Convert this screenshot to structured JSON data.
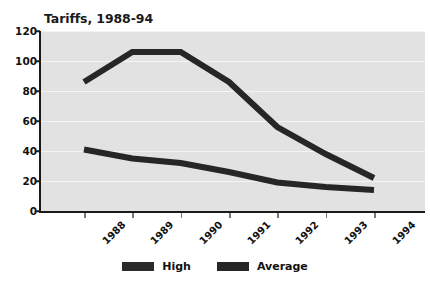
{
  "chart_data": {
    "type": "line",
    "title": "Tariffs, 1988-94",
    "xlabel": "",
    "ylabel": "",
    "categories": [
      "1988",
      "1989",
      "1990",
      "1991",
      "1992",
      "1993",
      "1994"
    ],
    "series": [
      {
        "name": "High",
        "values": [
          86,
          106,
          106,
          86,
          56,
          38,
          22
        ]
      },
      {
        "name": "Average",
        "values": [
          41,
          35,
          32,
          26,
          19,
          16,
          14
        ]
      }
    ],
    "ylim": [
      0,
      120
    ],
    "yticks": [
      0,
      20,
      40,
      60,
      80,
      100,
      120
    ],
    "ytick_labels": [
      "0",
      "20",
      "40",
      "60",
      "80",
      "100",
      "120"
    ],
    "grid": true,
    "grid_axis": "y",
    "legend_position": "bottom",
    "legend_entries": [
      "High",
      "Average"
    ],
    "colors": {
      "high": "#262626",
      "average": "#262626",
      "plot_background": "#e2e2e2",
      "gridline": "#f4f4f4",
      "axis": "#1a1a1a",
      "text": "#111111",
      "figure_background": "#ffffff"
    }
  }
}
